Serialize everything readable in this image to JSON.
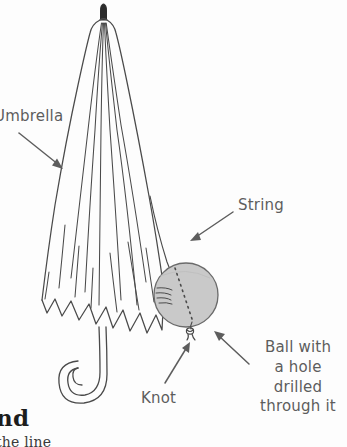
{
  "figure": {
    "background_color": "#fdfdfd",
    "ink_color": "#4a4a4a",
    "label_color": "#5d5d5d",
    "ball_fill_color": "#c9c9c9",
    "ball_stroke_color": "#6a6a6a",
    "tip_color": "#2b2b2b"
  },
  "labels": {
    "umbrella": "Umbrella",
    "string": "String",
    "knot": "Knot",
    "ball_line_1": "Ball with",
    "ball_line_2": "a hole",
    "ball_line_3": "drilled",
    "ball_line_4": "through it"
  },
  "page_text": {
    "heading_fragment": "nd",
    "body_fragment": "the line"
  },
  "parts": {
    "umbrella_tip": "umbrella-tip-ferrule",
    "canopy": "umbrella-canopy",
    "handle": "umbrella-hook-handle",
    "string": "hanging-string",
    "ball": "wooden-ball",
    "hole": "drilled-hole-dashed-line",
    "knot": "string-knot"
  }
}
